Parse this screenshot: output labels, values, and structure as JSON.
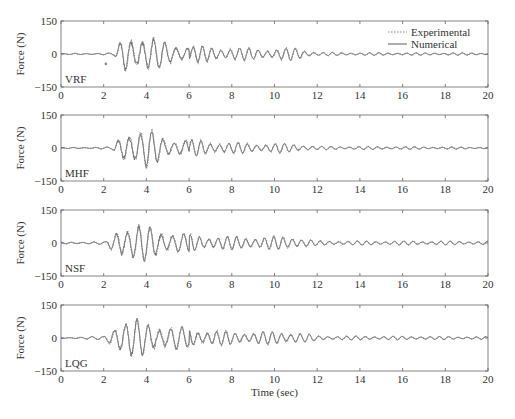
{
  "chart_data": {
    "type": "line",
    "title": "",
    "xlabel": "Time (sec)",
    "ylabel": "Force (N)",
    "xlim": [
      0,
      20
    ],
    "ylim": [
      -150,
      150
    ],
    "xticks": [
      0,
      2,
      4,
      6,
      8,
      10,
      12,
      14,
      16,
      18,
      20
    ],
    "yticks": [
      -150,
      0,
      150
    ],
    "grid": false,
    "legend": {
      "position": "upper right (first panel only)",
      "entries": [
        {
          "name": "Experimental",
          "style": "dotted",
          "color": "#888888"
        },
        {
          "name": "Numerical",
          "style": "solid",
          "color": "#555555"
        }
      ]
    },
    "series": [
      {
        "name": "Experimental",
        "description": "Measured force response"
      },
      {
        "name": "Numerical",
        "description": "Simulated force response"
      }
    ],
    "panels": [
      {
        "label": "VRF",
        "onset_sec": 2.5,
        "peak_abs_N": 115,
        "envelope": [
          {
            "t": 0,
            "amp": 2
          },
          {
            "t": 2.5,
            "amp": 5
          },
          {
            "t": 3.0,
            "amp": 100
          },
          {
            "t": 4.0,
            "amp": 85
          },
          {
            "t": 5.0,
            "amp": 55
          },
          {
            "t": 6.0,
            "amp": 40
          },
          {
            "t": 8.0,
            "amp": 30
          },
          {
            "t": 10.0,
            "amp": 25
          },
          {
            "t": 11.0,
            "amp": 30
          },
          {
            "t": 12.0,
            "amp": 8
          },
          {
            "t": 14.0,
            "amp": 6
          },
          {
            "t": 20.0,
            "amp": 5
          }
        ],
        "outlier": {
          "t": 2.1,
          "value": -45
        }
      },
      {
        "label": "MHF",
        "onset_sec": 2.4,
        "peak_abs_N": 95,
        "envelope": [
          {
            "t": 0,
            "amp": 2
          },
          {
            "t": 2.4,
            "amp": 5
          },
          {
            "t": 3.0,
            "amp": 90
          },
          {
            "t": 4.0,
            "amp": 90
          },
          {
            "t": 5.0,
            "amp": 50
          },
          {
            "t": 6.0,
            "amp": 40
          },
          {
            "t": 8.0,
            "amp": 25
          },
          {
            "t": 10.0,
            "amp": 22
          },
          {
            "t": 11.0,
            "amp": 20
          },
          {
            "t": 12.0,
            "amp": 8
          },
          {
            "t": 20.0,
            "amp": 4
          }
        ]
      },
      {
        "label": "NSF",
        "onset_sec": 2.1,
        "peak_abs_N": 100,
        "envelope": [
          {
            "t": 0,
            "amp": 4
          },
          {
            "t": 2.1,
            "amp": 6
          },
          {
            "t": 2.8,
            "amp": 95
          },
          {
            "t": 4.0,
            "amp": 80
          },
          {
            "t": 5.0,
            "amp": 60
          },
          {
            "t": 6.0,
            "amp": 40
          },
          {
            "t": 8.0,
            "amp": 30
          },
          {
            "t": 10.0,
            "amp": 30
          },
          {
            "t": 11.0,
            "amp": 30
          },
          {
            "t": 12.0,
            "amp": 10
          },
          {
            "t": 20.0,
            "amp": 8
          }
        ]
      },
      {
        "label": "LQG",
        "onset_sec": 2.0,
        "peak_abs_N": 100,
        "envelope": [
          {
            "t": 0,
            "amp": 2
          },
          {
            "t": 2.0,
            "amp": 8
          },
          {
            "t": 2.7,
            "amp": 95
          },
          {
            "t": 4.0,
            "amp": 80
          },
          {
            "t": 5.0,
            "amp": 60
          },
          {
            "t": 6.0,
            "amp": 45
          },
          {
            "t": 8.0,
            "amp": 30
          },
          {
            "t": 10.0,
            "amp": 30
          },
          {
            "t": 11.0,
            "amp": 28
          },
          {
            "t": 12.0,
            "amp": 10
          },
          {
            "t": 20.0,
            "amp": 6
          }
        ]
      }
    ]
  },
  "labels": {
    "ylabel": "Force (N)",
    "xlabel": "Time (sec)",
    "legend_experimental": "Experimental",
    "legend_numerical": "Numerical",
    "panel_labels": [
      "VRF",
      "MHF",
      "NSF",
      "LQG"
    ],
    "xtick_labels": [
      "0",
      "2",
      "4",
      "6",
      "8",
      "10",
      "12",
      "14",
      "16",
      "18",
      "20"
    ],
    "ytick_labels": [
      "150",
      "0",
      "−150"
    ]
  },
  "colors": {
    "experimental": "#8a8a8a",
    "numerical": "#4a4a4a",
    "axes": "#666666"
  }
}
